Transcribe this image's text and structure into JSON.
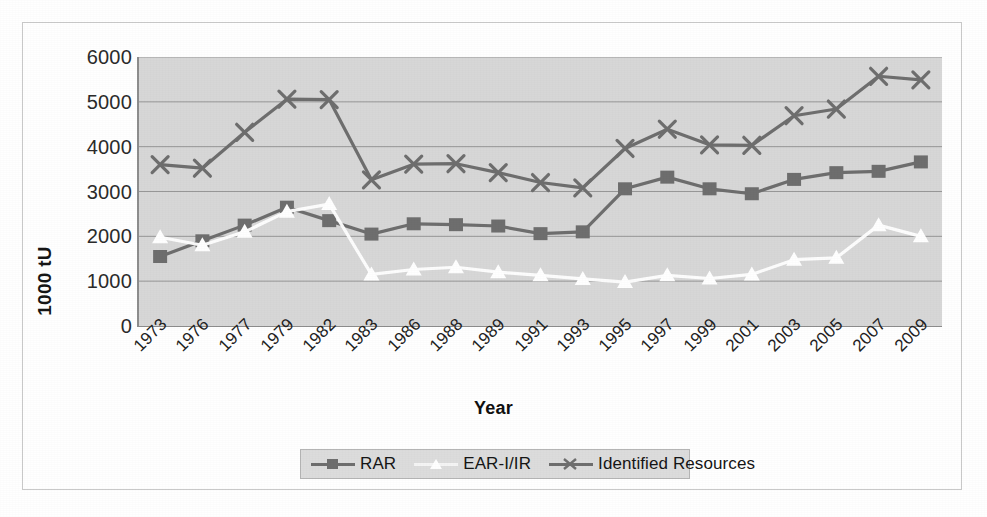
{
  "chart_data": {
    "type": "line",
    "title": "",
    "xlabel": "Year",
    "ylabel": "1000 tU",
    "ylim": [
      0,
      6000
    ],
    "ytick_values": [
      6000,
      5000,
      4000,
      3000,
      2000,
      1000,
      0
    ],
    "ytick_labels": [
      "6000",
      "5000",
      "4000",
      "3000",
      "2000",
      "1000",
      "0"
    ],
    "grid": "horizontal",
    "legend_position": "bottom",
    "categories": [
      "1973",
      "1976",
      "1977",
      "1979",
      "1982",
      "1983",
      "1986",
      "1988",
      "1989",
      "1991",
      "1993",
      "1995",
      "1997",
      "1999",
      "2001",
      "2003",
      "2005",
      "2007",
      "2009"
    ],
    "series": [
      {
        "name": "RAR",
        "marker": "square",
        "color": "#6e6e6e",
        "values": [
          1550,
          1900,
          2250,
          2650,
          2350,
          2050,
          2280,
          2260,
          2230,
          2060,
          2100,
          3060,
          3320,
          3060,
          2950,
          3270,
          3420,
          3450,
          3660
        ]
      },
      {
        "name": "EAR-I/IR",
        "marker": "triangle",
        "color": "#ffffff",
        "values": [
          1980,
          1800,
          2100,
          2550,
          2720,
          1150,
          1260,
          1310,
          1200,
          1130,
          1050,
          980,
          1130,
          1060,
          1150,
          1480,
          1520,
          2250,
          2000
        ]
      },
      {
        "name": "Identified Resources",
        "marker": "x",
        "color": "#6e6e6e",
        "values": [
          3600,
          3520,
          4320,
          5060,
          5050,
          3260,
          3610,
          3620,
          3420,
          3200,
          3080,
          3960,
          4390,
          4040,
          4030,
          4690,
          4840,
          5570,
          5490
        ]
      }
    ]
  },
  "legend": {
    "items": [
      {
        "label": "RAR",
        "marker": "square"
      },
      {
        "label": "EAR-I/IR",
        "marker": "triangle"
      },
      {
        "label": "Identified Resources",
        "marker": "x"
      }
    ]
  },
  "colors": {
    "plot_background": "#d7d7d7",
    "gridline": "#8d8d8d",
    "axis": "#8d8d8d",
    "series_dark": "#6e6e6e",
    "series_light": "#ffffff",
    "legend_background": "#dcdcdc",
    "frame": "#c9c9c9"
  },
  "caption": ""
}
